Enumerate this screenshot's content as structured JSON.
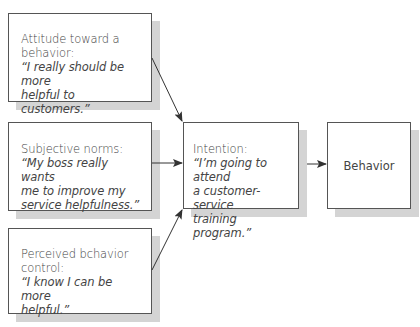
{
  "diagram": {
    "type": "flow",
    "title": "",
    "boxes": {
      "attitude": {
        "label_line1": "Attitude toward a",
        "label_line2": "behavior:",
        "quote_line1": "“I really should be more",
        "quote_line2": "helpful to customers.”"
      },
      "norms": {
        "label": "Subjective norms:",
        "quote_line1": "“My boss really wants",
        "quote_line2": "me to improve my",
        "quote_line3": "service helpfulness.”"
      },
      "control": {
        "label_line1": "Perceived bchavior",
        "label_line2": "control:",
        "quote_line1": "“I know I can be more",
        "quote_line2": "helpful.”"
      },
      "intention": {
        "label": "Intention:",
        "quote_line1": "“I’m going to attend",
        "quote_line2": "a customer-service",
        "quote_line3": "training program.”"
      },
      "behavior": {
        "label": "Behavior"
      }
    },
    "edges": [
      {
        "from": "attitude",
        "to": "intention"
      },
      {
        "from": "norms",
        "to": "intention"
      },
      {
        "from": "control",
        "to": "intention"
      },
      {
        "from": "intention",
        "to": "behavior"
      }
    ],
    "colors": {
      "border": "#555555",
      "shadow": "#d4d4d4",
      "text": "#444444",
      "arrow": "#333333"
    }
  }
}
